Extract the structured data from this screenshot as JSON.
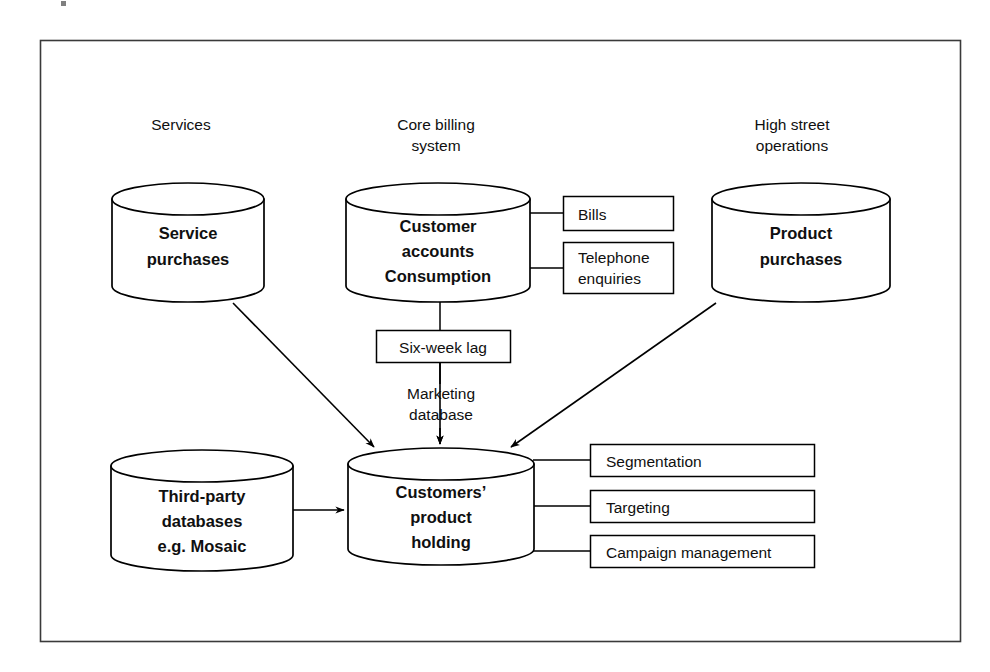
{
  "figure": {
    "frame": {
      "stroke": "#3a3a3a"
    },
    "ink": "#000000",
    "background": "#ffffff"
  },
  "group_labels": [
    {
      "id": "services",
      "text": "Services"
    },
    {
      "id": "core-billing",
      "line1": "Core billing",
      "line2": "system"
    },
    {
      "id": "high-street",
      "line1": "High street",
      "line2": "operations"
    }
  ],
  "data_stores": [
    {
      "id": "service-purchases",
      "lines": [
        "Service",
        "purchases"
      ]
    },
    {
      "id": "customer-accounts",
      "lines": [
        "Customer",
        "accounts",
        "Consumption"
      ]
    },
    {
      "id": "product-purchases",
      "lines": [
        "Product",
        "purchases"
      ]
    },
    {
      "id": "third-party-databases",
      "lines": [
        "Third-party",
        "databases",
        "e.g. Mosaic"
      ]
    },
    {
      "id": "customers-product-holding",
      "lines": [
        "Customers’",
        "product",
        "holding"
      ]
    }
  ],
  "process_boxes": [
    {
      "id": "bills",
      "label": "Bills"
    },
    {
      "id": "telephone-enquiries",
      "line1": "Telephone",
      "line2": "enquiries"
    },
    {
      "id": "six-week-lag",
      "label": "Six-week lag"
    },
    {
      "id": "segmentation",
      "label": "Segmentation"
    },
    {
      "id": "targeting",
      "label": "Targeting"
    },
    {
      "id": "campaign-management",
      "label": "Campaign management"
    }
  ],
  "edge_labels": [
    {
      "id": "marketing-database",
      "line1": "Marketing",
      "line2": "database"
    }
  ]
}
